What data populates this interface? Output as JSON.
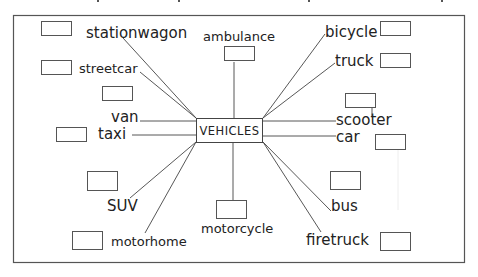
{
  "diagram": {
    "center": "VEHICLES",
    "items": [
      {
        "key": "stationwagon",
        "label": "stationwagon"
      },
      {
        "key": "streetcar",
        "label": "streetcar"
      },
      {
        "key": "van",
        "label": "van"
      },
      {
        "key": "taxi",
        "label": "taxi"
      },
      {
        "key": "suv",
        "label": "SUV"
      },
      {
        "key": "motorhome",
        "label": "motorhome"
      },
      {
        "key": "ambulance",
        "label": "ambulance"
      },
      {
        "key": "motorcycle",
        "label": "motorcycle"
      },
      {
        "key": "bicycle",
        "label": "bicycle"
      },
      {
        "key": "truck",
        "label": "truck"
      },
      {
        "key": "scooter",
        "label": "scooter"
      },
      {
        "key": "car",
        "label": "car"
      },
      {
        "key": "bus",
        "label": "bus"
      },
      {
        "key": "firetruck",
        "label": "firetruck"
      }
    ],
    "answer_boxes": [
      {
        "for": "stationwagon",
        "value": ""
      },
      {
        "for": "streetcar",
        "value": ""
      },
      {
        "for": "van",
        "value": ""
      },
      {
        "for": "taxi",
        "value": ""
      },
      {
        "for": "suv",
        "value": ""
      },
      {
        "for": "motorhome",
        "value": ""
      },
      {
        "for": "ambulance",
        "value": ""
      },
      {
        "for": "motorcycle",
        "value": ""
      },
      {
        "for": "bicycle",
        "value": ""
      },
      {
        "for": "truck",
        "value": ""
      },
      {
        "for": "scooter",
        "value": ""
      },
      {
        "for": "car",
        "value": ""
      },
      {
        "for": "bus",
        "value": ""
      },
      {
        "for": "firetruck",
        "value": ""
      }
    ]
  }
}
